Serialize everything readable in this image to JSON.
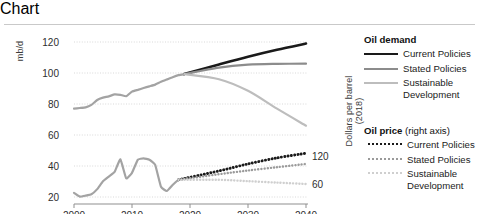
{
  "figure": {
    "left_axis_title": "mb/d",
    "right_axis_title": "Dollars per barrel (2018)"
  },
  "legend": {
    "demand": {
      "title": "Oil demand",
      "items": [
        {
          "label": "Current Policies",
          "style": "solid",
          "color": "#1a1a1a"
        },
        {
          "label": "Stated Policies",
          "style": "solid",
          "color": "#8c8c8c"
        },
        {
          "label": "Sustainable Development",
          "style": "solid",
          "color": "#bdbdbd"
        }
      ]
    },
    "price": {
      "title": "Oil price",
      "title_suffix": "(right axis)",
      "items": [
        {
          "label": "Current Policies",
          "style": "dotted",
          "color": "#1a1a1a"
        },
        {
          "label": "Stated Policies",
          "style": "dotted",
          "color": "#9a9a9a"
        },
        {
          "label": "Sustainable Development",
          "style": "dotted",
          "color": "#cfcfcf"
        }
      ]
    }
  },
  "chart_data": {
    "type": "line",
    "title": "",
    "xlabel": "",
    "ylabel": "mb/d",
    "y2label": "Dollars per barrel (2018)",
    "xlim": [
      2000,
      2040
    ],
    "ylim": [
      10,
      126
    ],
    "y2lim": [
      0,
      150
    ],
    "grid": true,
    "legend_position": "right",
    "xticks": [
      2000,
      2010,
      2020,
      2030,
      2040
    ],
    "yticks": [
      20,
      40,
      60,
      80,
      100,
      120
    ],
    "y2ticks": [
      60,
      120
    ],
    "series": [
      {
        "name": "Oil demand history",
        "axis": "left",
        "style": "solid",
        "color": "#a3a3a3",
        "x": [
          2000,
          2001,
          2002,
          2003,
          2004,
          2005,
          2006,
          2007,
          2008,
          2009,
          2010,
          2011,
          2012,
          2013,
          2014,
          2015,
          2016,
          2017,
          2018,
          2019
        ],
        "values": [
          77.0,
          77.4,
          77.8,
          79.4,
          82.6,
          84.1,
          84.9,
          86.2,
          85.9,
          85.0,
          88.0,
          89.1,
          90.3,
          91.4,
          92.5,
          94.3,
          95.8,
          97.3,
          98.6,
          99.3
        ]
      },
      {
        "name": "Oil demand Current Policies",
        "axis": "left",
        "style": "solid",
        "color": "#1a1a1a",
        "x": [
          2019,
          2025,
          2030,
          2035,
          2040
        ],
        "values": [
          99.3,
          105.5,
          110.5,
          115.0,
          119.0
        ]
      },
      {
        "name": "Oil demand Stated Policies",
        "axis": "left",
        "style": "solid",
        "color": "#8c8c8c",
        "x": [
          2019,
          2025,
          2030,
          2035,
          2040
        ],
        "values": [
          99.3,
          103.5,
          105.4,
          105.9,
          106.0
        ]
      },
      {
        "name": "Oil demand Sustainable Development",
        "axis": "left",
        "style": "solid",
        "color": "#bdbdbd",
        "x": [
          2019,
          2025,
          2030,
          2035,
          2040
        ],
        "values": [
          99.3,
          96.0,
          88.5,
          77.0,
          66.0
        ]
      },
      {
        "name": "Oil price history",
        "axis": "right",
        "style": "solid",
        "color": "#a3a3a3",
        "x": [
          2000,
          2001,
          2002,
          2003,
          2004,
          2005,
          2006,
          2007,
          2008,
          2009,
          2010,
          2011,
          2012,
          2013,
          2014,
          2015,
          2016,
          2017,
          2018
        ],
        "values": [
          41,
          33,
          35,
          38,
          49,
          66,
          76,
          86,
          113,
          72,
          84,
          112,
          115,
          112,
          101,
          54,
          45,
          58,
          69
        ]
      },
      {
        "name": "Oil price Current Policies",
        "axis": "right",
        "style": "dotted",
        "color": "#1a1a1a",
        "x": [
          2018,
          2025,
          2030,
          2035,
          2040
        ],
        "values": [
          69,
          88,
          103,
          116,
          126
        ]
      },
      {
        "name": "Oil price Stated Policies",
        "axis": "right",
        "style": "dotted",
        "color": "#9a9a9a",
        "x": [
          2018,
          2025,
          2030,
          2035,
          2040
        ],
        "values": [
          69,
          81,
          89,
          96,
          103
        ]
      },
      {
        "name": "Oil price Sustainable Development",
        "axis": "right",
        "style": "dotted",
        "color": "#cfcfcf",
        "x": [
          2018,
          2025,
          2030,
          2035,
          2040
        ],
        "values": [
          69,
          69,
          66,
          63,
          60
        ]
      }
    ]
  }
}
